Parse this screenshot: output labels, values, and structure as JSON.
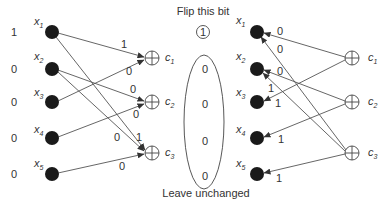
{
  "diagram": {
    "title_top": "Flip this bit",
    "title_bottom": "Leave unchanged",
    "flip_bit_value": "1",
    "unchanged_values": [
      "0",
      "0",
      "0",
      "0"
    ],
    "left_panel": {
      "input_bits": [
        "1",
        "0",
        "0",
        "0",
        "0"
      ],
      "variable_nodes": [
        {
          "name": "x",
          "sub": "1"
        },
        {
          "name": "x",
          "sub": "2"
        },
        {
          "name": "x",
          "sub": "3"
        },
        {
          "name": "x",
          "sub": "4"
        },
        {
          "name": "x",
          "sub": "5"
        }
      ],
      "check_nodes": [
        {
          "name": "c",
          "sub": "1"
        },
        {
          "name": "c",
          "sub": "2"
        },
        {
          "name": "c",
          "sub": "3"
        }
      ],
      "edges": [
        {
          "from": "x1",
          "to": "c1",
          "label": "1"
        },
        {
          "from": "x3",
          "to": "c1",
          "label": "0"
        },
        {
          "from": "x2",
          "to": "c2",
          "label": "0"
        },
        {
          "from": "x4",
          "to": "c2",
          "label": "0"
        },
        {
          "from": "x1",
          "to": "c3",
          "label": "0"
        },
        {
          "from": "x2",
          "to": "c3",
          "label": "1"
        },
        {
          "from": "x5",
          "to": "c3",
          "label": "0"
        }
      ]
    },
    "right_panel": {
      "variable_nodes": [
        {
          "name": "x",
          "sub": "1"
        },
        {
          "name": "x",
          "sub": "2"
        },
        {
          "name": "x",
          "sub": "3"
        },
        {
          "name": "x",
          "sub": "4"
        },
        {
          "name": "x",
          "sub": "5"
        }
      ],
      "check_nodes": [
        {
          "name": "c",
          "sub": "1"
        },
        {
          "name": "c",
          "sub": "2"
        },
        {
          "name": "c",
          "sub": "3"
        }
      ],
      "edges": [
        {
          "from": "c1",
          "to": "x1",
          "label": "0"
        },
        {
          "from": "c1",
          "to": "x3",
          "label": "1"
        },
        {
          "from": "c2",
          "to": "x2",
          "label": "0"
        },
        {
          "from": "c2",
          "to": "x4",
          "label": "1"
        },
        {
          "from": "c3",
          "to": "x1",
          "label": "0"
        },
        {
          "from": "c3",
          "to": "x2",
          "label": "1"
        },
        {
          "from": "c3",
          "to": "x5",
          "label": "1"
        }
      ],
      "x3_incoming_label": "1"
    }
  }
}
